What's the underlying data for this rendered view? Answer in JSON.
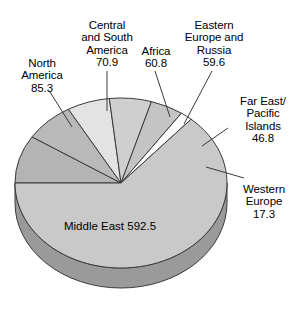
{
  "chart_data": {
    "type": "pie",
    "title": "",
    "subtitle": "",
    "xlabel": "",
    "ylabel": "",
    "legend_position": "callout-labels",
    "grid": false,
    "total": 933.2,
    "units": "",
    "categories": [
      "North America",
      "Central and South America",
      "Africa",
      "Eastern Europe and Russia",
      "Far East/ Pacific Islands",
      "Western Europe",
      "Middle East"
    ],
    "values": [
      85.3,
      70.9,
      60.8,
      59.6,
      46.8,
      17.3,
      592.5
    ],
    "slices": [
      {
        "label": "North America",
        "value": 85.3,
        "color": "#b4b4b4",
        "start_deg": 180,
        "sweep_deg": 32.9
      },
      {
        "label": "Central and South America",
        "value": 70.9,
        "color": "#b9b9b9",
        "start_deg": 212.9,
        "sweep_deg": 27.35
      },
      {
        "label": "Africa",
        "value": 60.8,
        "color": "#e3e3e3",
        "start_deg": 240.25,
        "sweep_deg": 23.45
      },
      {
        "label": "Eastern Europe and Russia",
        "value": 59.6,
        "color": "#cfcfcf",
        "start_deg": 263.7,
        "sweep_deg": 23.0
      },
      {
        "label": "Far East/ Pacific Islands",
        "value": 46.8,
        "color": "#c4c4c4",
        "start_deg": 286.7,
        "sweep_deg": 18.05
      },
      {
        "label": "Western Europe",
        "value": 17.3,
        "color": "#fdfdfd",
        "start_deg": 304.75,
        "sweep_deg": 6.67
      },
      {
        "label": "Middle East",
        "value": 592.5,
        "color": "#c9c9c9",
        "start_deg": 311.42,
        "sweep_deg": 228.58
      }
    ]
  },
  "labels": {
    "north_america": {
      "name": "North\nAmerica",
      "value": "85.3"
    },
    "central_south_america": {
      "name": "Central\nand South\nAmerica",
      "value": "70.9"
    },
    "africa": {
      "name": "Africa",
      "value": "60.8"
    },
    "eastern_europe_russia": {
      "name": "Eastern\nEurope and\nRussia",
      "value": "59.6"
    },
    "far_east_pacific": {
      "name": "Far East/\nPacific\nIslands",
      "value": "46.8"
    },
    "western_europe": {
      "name": "Western\nEurope",
      "value": "17.3"
    },
    "middle_east": {
      "name": "Middle East",
      "value": "592.5"
    }
  },
  "style": {
    "side_color": "#9a9a9a",
    "stroke_color": "#3a3a3a",
    "leader_color": "#3a3a3a"
  }
}
